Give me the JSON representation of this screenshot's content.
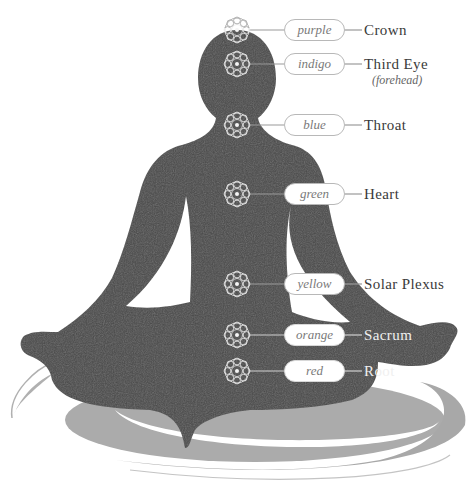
{
  "figure": {
    "title": "",
    "colors": {
      "silhouette": "#4a4a4a",
      "shadow": "#a9a9a9",
      "ring": "#b5b5b5",
      "bubble_border": "#b8b8b8",
      "label_text": "#3a3a3a",
      "bubble_text": "#7a7a7a",
      "flower_stroke": "#e6e6e6"
    }
  },
  "chakras": [
    {
      "id": "crown",
      "color_label": "purple",
      "name": "Crown",
      "sub": "",
      "icon": "lotus-flower-icon",
      "y": 30
    },
    {
      "id": "third-eye",
      "color_label": "indigo",
      "name": "Third Eye",
      "sub": "(forehead)",
      "icon": "lotus-flower-icon",
      "y": 64
    },
    {
      "id": "throat",
      "color_label": "blue",
      "name": "Throat",
      "sub": "",
      "icon": "lotus-flower-icon",
      "y": 125
    },
    {
      "id": "heart",
      "color_label": "green",
      "name": "Heart",
      "sub": "",
      "icon": "lotus-flower-icon",
      "y": 194
    },
    {
      "id": "solar-plexus",
      "color_label": "yellow",
      "name": "Solar Plexus",
      "sub": "",
      "icon": "lotus-flower-icon",
      "y": 284
    },
    {
      "id": "sacrum",
      "color_label": "orange",
      "name": "Sacrum",
      "sub": "",
      "icon": "lotus-flower-icon",
      "y": 335
    },
    {
      "id": "root",
      "color_label": "red",
      "name": "Root",
      "sub": "",
      "icon": "lotus-flower-icon",
      "y": 371
    }
  ]
}
